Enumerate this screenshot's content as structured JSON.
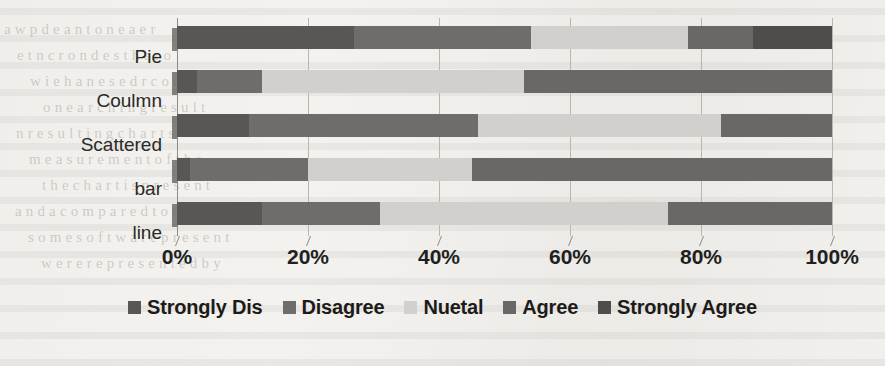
{
  "chart_data": {
    "type": "bar",
    "orientation": "horizontal",
    "stacked": true,
    "normalized": "100%",
    "title": "",
    "subtitle": "",
    "xlabel": "",
    "ylabel": "",
    "xlim": [
      0,
      100
    ],
    "xticks": [
      0,
      20,
      40,
      60,
      80,
      100
    ],
    "xtick_labels": [
      "0%",
      "20%",
      "40%",
      "60%",
      "80%",
      "100%"
    ],
    "grid": true,
    "legend_position": "bottom",
    "categories": [
      "line",
      "bar",
      "Scattered",
      "Coulmn",
      "Pie"
    ],
    "categories_top_to_bottom": [
      "Pie",
      "Coulmn",
      "Scattered",
      "bar",
      "line"
    ],
    "series": [
      {
        "name": "Strongly Dis",
        "color": "#595756",
        "values": [
          27,
          3,
          11,
          2,
          13
        ]
      },
      {
        "name": "Disagree",
        "color": "#6f6d6b",
        "values": [
          27,
          10,
          35,
          18,
          18
        ]
      },
      {
        "name": "Nuetal",
        "color": "#d2d0cd",
        "values": [
          24,
          40,
          37,
          25,
          44
        ]
      },
      {
        "name": "Agree",
        "color": "#6a6866",
        "values": [
          10,
          47,
          17,
          55,
          25
        ]
      },
      {
        "name": "Strongly Agree",
        "color": "#4f4d4c",
        "values": [
          12,
          0,
          0,
          0,
          0
        ]
      }
    ],
    "rows": [
      {
        "category": "Pie",
        "values": [
          27,
          27,
          24,
          10,
          12
        ],
        "cumulative": [
          27,
          54,
          78,
          88,
          100
        ]
      },
      {
        "category": "Coulmn",
        "values": [
          3,
          10,
          40,
          47,
          0
        ],
        "cumulative": [
          3,
          13,
          53,
          100,
          100
        ]
      },
      {
        "category": "Scattered",
        "values": [
          11,
          35,
          37,
          17,
          0
        ],
        "cumulative": [
          11,
          46,
          83,
          100,
          100
        ]
      },
      {
        "category": "bar",
        "values": [
          2,
          18,
          25,
          55,
          0
        ],
        "cumulative": [
          2,
          20,
          45,
          100,
          100
        ]
      },
      {
        "category": "line",
        "values": [
          13,
          18,
          44,
          25,
          0
        ],
        "cumulative": [
          13,
          31,
          75,
          100,
          100
        ]
      }
    ]
  },
  "legend": {
    "items": [
      {
        "label": "Strongly Dis",
        "color": "#595756"
      },
      {
        "label": "Disagree",
        "color": "#6f6d6b"
      },
      {
        "label": "Nuetal",
        "color": "#d2d0cd"
      },
      {
        "label": "Agree",
        "color": "#6a6866"
      },
      {
        "label": "Strongly Agree",
        "color": "#4f4d4c"
      }
    ]
  },
  "axis": {
    "x_tick_labels": [
      "0%",
      "20%",
      "40%",
      "60%",
      "80%",
      "100%"
    ],
    "y_tick_labels": [
      "Pie",
      "Coulmn",
      "Scattered",
      "bar",
      "line"
    ]
  },
  "background": {
    "ghost_lines": [
      "a  w      p     d   e   a     n   t o n      e   a e     r",
      "e      t   n         c      r  o   n   d  e  s   t h  e   r o",
      "w   i      e   h  a  n   e   s  e    d    r  c   o   u  n  t s",
      "o    n  e      a    r   c  h     i    n   g      r e  s u l t",
      "n     r e  s    u  l  t    i   n   g     c   h  a   r   t  s",
      "m   e  a  s  u   r   e  m   e   n   t       o  f      t h e",
      "t h e   c   h   a   r   t       i  s       p   r  e  s  e   n t",
      "a  n  d      a     c  o  m   p   a   r  e   d      t  o     t h",
      "s  o  m  e      s  o  f  t  w  a  r  e       p  r  e  s  e  n  t",
      "w  e  r  e       r  e  p  r  e  s  e  n  t  e  d      b  y"
    ]
  }
}
